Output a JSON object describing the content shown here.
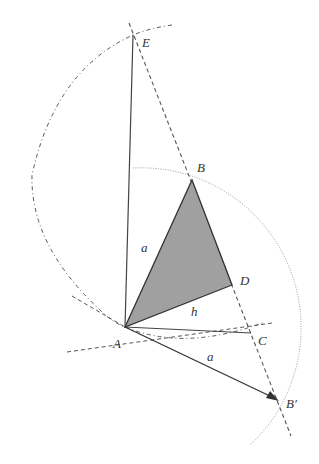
{
  "diagram": {
    "type": "geometric-construction",
    "points": {
      "A": {
        "label": "A",
        "x": 125,
        "y": 327
      },
      "B": {
        "label": "B",
        "x": 192,
        "y": 180
      },
      "C": {
        "label": "C",
        "x": 251,
        "y": 333
      },
      "D": {
        "label": "D",
        "x": 232,
        "y": 285
      },
      "E": {
        "label": "E",
        "x": 133,
        "y": 35
      },
      "B_prime": {
        "label": "B′",
        "x": 278,
        "y": 400
      }
    },
    "segment_labels": {
      "AB": "a",
      "AD": "h",
      "AB_prime": "a"
    },
    "colors": {
      "stroke": "#333333",
      "fill_triangle": "#a0a0a0",
      "construction": "#555555",
      "arc_dotted": "#999999"
    }
  }
}
